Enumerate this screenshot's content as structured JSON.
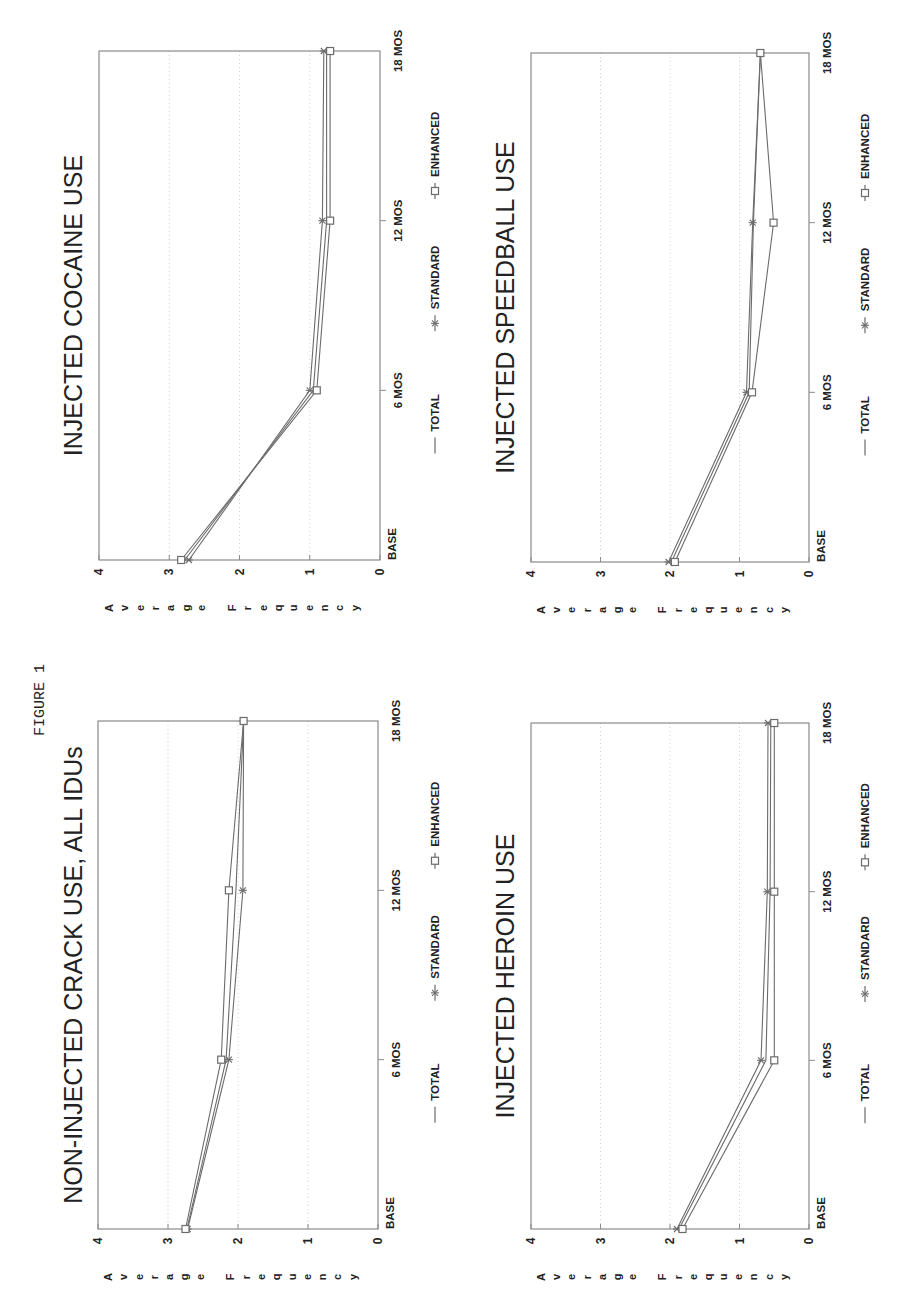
{
  "figure_label": "FIGURE 1",
  "axis": {
    "ylabel": "Average Frequency",
    "y_ticks": [
      "0",
      "1",
      "2",
      "3",
      "4"
    ],
    "x_ticks": [
      "BASE",
      "6 MOS",
      "12 MOS",
      "18 MOS"
    ]
  },
  "legend": [
    {
      "name": "TOTAL",
      "marker": "none"
    },
    {
      "name": "STANDARD",
      "marker": "star"
    },
    {
      "name": "ENHANCED",
      "marker": "square"
    }
  ],
  "colors": {
    "line": "#6b6b6b",
    "frame": "#8a8a8a",
    "grid": "#cfcfcf",
    "text": "#222222"
  },
  "chart_data": [
    {
      "type": "line",
      "title": "INJECTED COCAINE USE",
      "position": "top-left",
      "frame": {
        "x": 99,
        "y": 51,
        "w": 281,
        "h": 509
      },
      "title_x": 70,
      "legend_x": 435,
      "categories": [
        "BASE",
        "6 MOS",
        "12 MOS",
        "18 MOS"
      ],
      "xlabel": "",
      "ylabel": "Average Frequency",
      "ylim": [
        0,
        4
      ],
      "series": [
        {
          "name": "TOTAL",
          "values": [
            2.78,
            0.95,
            0.76,
            0.76
          ]
        },
        {
          "name": "STANDARD",
          "values": [
            2.72,
            1.0,
            0.82,
            0.8
          ]
        },
        {
          "name": "ENHANCED",
          "values": [
            2.83,
            0.9,
            0.71,
            0.71
          ]
        }
      ]
    },
    {
      "type": "line",
      "title": "INJECTED SPEEDBALL USE",
      "position": "top-right",
      "frame": {
        "x": 531,
        "y": 53,
        "w": 278,
        "h": 509
      },
      "title_x": 502,
      "legend_x": 865,
      "categories": [
        "BASE",
        "6 MOS",
        "12 MOS",
        "18 MOS"
      ],
      "xlabel": "",
      "ylabel": "Average Frequency",
      "ylim": [
        0,
        4
      ],
      "series": [
        {
          "name": "TOTAL",
          "values": [
            1.98,
            0.86,
            0.8,
            0.7
          ]
        },
        {
          "name": "STANDARD",
          "values": [
            2.02,
            0.9,
            0.81,
            0.7
          ]
        },
        {
          "name": "ENHANCED",
          "values": [
            1.93,
            0.82,
            0.51,
            0.7
          ]
        }
      ]
    },
    {
      "type": "line",
      "title": "NON-INJECTED CRACK USE, ALL IDUs",
      "position": "bottom-left",
      "frame": {
        "x": 98,
        "y": 721,
        "w": 280,
        "h": 508
      },
      "title_x": 70,
      "legend_x": 435,
      "categories": [
        "BASE",
        "6 MOS",
        "12 MOS",
        "18 MOS"
      ],
      "xlabel": "",
      "ylabel": "Average Frequency",
      "ylim": [
        0,
        4
      ],
      "series": [
        {
          "name": "TOTAL",
          "values": [
            2.73,
            2.17,
            2.03,
            1.92
          ]
        },
        {
          "name": "STANDARD",
          "values": [
            2.72,
            2.13,
            1.93,
            1.92
          ]
        },
        {
          "name": "ENHANCED",
          "values": [
            2.75,
            2.24,
            2.13,
            1.92
          ]
        }
      ]
    },
    {
      "type": "line",
      "title": "INJECTED HEROIN USE",
      "position": "bottom-right",
      "frame": {
        "x": 531,
        "y": 723,
        "w": 278,
        "h": 506
      },
      "title_x": 502,
      "legend_x": 865,
      "categories": [
        "BASE",
        "6 MOS",
        "12 MOS",
        "18 MOS"
      ],
      "xlabel": "",
      "ylabel": "Average Frequency",
      "ylim": [
        0,
        4
      ],
      "series": [
        {
          "name": "TOTAL",
          "values": [
            1.87,
            0.62,
            0.56,
            0.55
          ]
        },
        {
          "name": "STANDARD",
          "values": [
            1.9,
            0.69,
            0.6,
            0.59
          ]
        },
        {
          "name": "ENHANCED",
          "values": [
            1.82,
            0.5,
            0.5,
            0.5
          ]
        }
      ]
    }
  ]
}
